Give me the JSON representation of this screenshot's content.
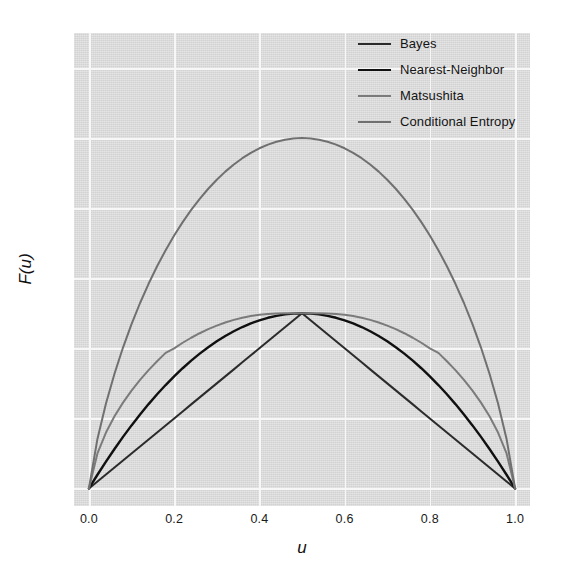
{
  "chart_data": {
    "type": "line",
    "title": "",
    "xlabel": "u",
    "ylabel": "F(u)",
    "xlim": [
      -0.035,
      1.035
    ],
    "ylim": [
      -0.05,
      1.3
    ],
    "xticks": [
      "0.0",
      "0.2",
      "0.4",
      "0.6",
      "0.8",
      "1.0"
    ],
    "xtick_values": [
      0.0,
      0.2,
      0.4,
      0.6,
      0.8,
      1.0
    ],
    "yticks": [
      "0.0",
      "0.2",
      "0.4",
      "0.6",
      "0.8",
      "1.0",
      "1.2"
    ],
    "ytick_values": [
      0.0,
      0.2,
      0.4,
      0.6,
      0.8,
      1.0,
      1.2
    ],
    "grid": true,
    "grid_color": "#f7f7f7",
    "plot_bgcolor": "#dcdcdc",
    "legend_position": "top-right",
    "x": [
      0.0,
      0.02,
      0.04,
      0.06,
      0.08,
      0.1,
      0.12,
      0.14,
      0.16,
      0.18,
      0.2,
      0.22,
      0.24,
      0.26,
      0.28,
      0.3,
      0.32,
      0.34,
      0.36,
      0.38,
      0.4,
      0.42,
      0.44,
      0.46,
      0.48,
      0.5,
      0.52,
      0.54,
      0.56,
      0.58,
      0.6,
      0.62,
      0.64,
      0.66,
      0.68,
      0.7,
      0.72,
      0.74,
      0.76,
      0.78,
      0.8,
      0.82,
      0.84,
      0.86,
      0.88,
      0.9,
      0.92,
      0.94,
      0.96,
      0.98,
      1.0
    ],
    "series": [
      {
        "name": "Bayes",
        "color": "#2b2b2b",
        "width": 2.0,
        "formula": "min(u, 1-u)",
        "values": [
          0.0,
          0.02,
          0.04,
          0.06,
          0.08,
          0.1,
          0.12,
          0.14,
          0.16,
          0.18,
          0.2,
          0.22,
          0.24,
          0.26,
          0.28,
          0.3,
          0.32,
          0.34,
          0.36,
          0.38,
          0.4,
          0.42,
          0.44,
          0.46,
          0.48,
          0.5,
          0.48,
          0.46,
          0.44,
          0.42,
          0.4,
          0.38,
          0.36,
          0.34,
          0.32,
          0.3,
          0.28,
          0.26,
          0.24,
          0.22,
          0.2,
          0.18,
          0.16,
          0.14,
          0.12,
          0.1,
          0.08,
          0.06,
          0.04,
          0.02,
          0.0
        ]
      },
      {
        "name": "Nearest-Neighbor",
        "color": "#101010",
        "width": 2.4,
        "formula": "2u(1-u)",
        "values": [
          0.0,
          0.0392,
          0.0768,
          0.1128,
          0.1472,
          0.18,
          0.2112,
          0.2408,
          0.2688,
          0.2952,
          0.32,
          0.3432,
          0.3648,
          0.3848,
          0.4032,
          0.42,
          0.4352,
          0.4488,
          0.4608,
          0.4712,
          0.48,
          0.4872,
          0.4928,
          0.4968,
          0.4992,
          0.5,
          0.4992,
          0.4968,
          0.4928,
          0.4872,
          0.48,
          0.4712,
          0.4608,
          0.4488,
          0.4352,
          0.42,
          0.4032,
          0.3848,
          0.3648,
          0.3432,
          0.32,
          0.2952,
          0.2688,
          0.2408,
          0.2112,
          0.18,
          0.1472,
          0.1128,
          0.0768,
          0.0392,
          0.0
        ]
      },
      {
        "name": "Matsushita",
        "color": "#7b7b7b",
        "width": 2.0,
        "formula": "(1 - sqrt(1 - 4u(1-u)))/2",
        "values": [
          0.0,
          0.1,
          0.1596,
          0.2059,
          0.245,
          0.2792,
          0.3098,
          0.3377,
          0.3633,
          0.387,
          0.4,
          0.4159,
          0.4302,
          0.4431,
          0.4546,
          0.4648,
          0.4737,
          0.4812,
          0.4875,
          0.4925,
          0.4959,
          0.498,
          0.4994,
          0.4999,
          0.5,
          0.5,
          0.5,
          0.4999,
          0.4994,
          0.498,
          0.4959,
          0.4925,
          0.4875,
          0.4812,
          0.4737,
          0.4648,
          0.4546,
          0.4431,
          0.4302,
          0.4159,
          0.4,
          0.387,
          0.3633,
          0.3377,
          0.3098,
          0.2792,
          0.245,
          0.2059,
          0.1596,
          0.1,
          0.0
        ]
      },
      {
        "name": "Conditional Entropy",
        "color": "#707070",
        "width": 2.0,
        "formula": "-u log2(u) - (1-u) log2(1-u)",
        "values": [
          0.0,
          0.1414,
          0.2423,
          0.3274,
          0.4022,
          0.469,
          0.5294,
          0.5842,
          0.6343,
          0.6801,
          0.7219,
          0.7602,
          0.795,
          0.8267,
          0.8555,
          0.8813,
          0.9044,
          0.9248,
          0.9427,
          0.958,
          0.971,
          0.9815,
          0.9896,
          0.9954,
          0.9988,
          1.0,
          0.9988,
          0.9954,
          0.9896,
          0.9815,
          0.971,
          0.958,
          0.9427,
          0.9248,
          0.9044,
          0.8813,
          0.8555,
          0.8267,
          0.795,
          0.7602,
          0.7219,
          0.6801,
          0.6343,
          0.5842,
          0.5294,
          0.469,
          0.4022,
          0.3274,
          0.2423,
          0.1414,
          0.0
        ]
      }
    ]
  }
}
